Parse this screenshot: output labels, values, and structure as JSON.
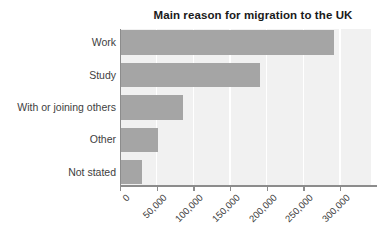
{
  "title": "Main reason for migration to the UK",
  "chart_data": {
    "type": "bar",
    "orientation": "horizontal",
    "title": "Main reason for migration to the UK",
    "categories": [
      "Work",
      "Study",
      "With or joining others",
      "Other",
      "Not stated"
    ],
    "values": [
      290000,
      190000,
      85000,
      51000,
      28000
    ],
    "xlabel": "",
    "ylabel": "",
    "x_ticks": [
      "0",
      "50,000",
      "100,000",
      "150,000",
      "200,000",
      "250,000",
      "300,000"
    ],
    "x_tick_values": [
      0,
      50000,
      100000,
      150000,
      200000,
      250000,
      300000
    ],
    "xlim": [
      0,
      342000
    ],
    "grid": true,
    "legend": false,
    "colors": {
      "bar": "#a5a5a5",
      "plot_background": "#f1f1f1",
      "gridline": "#ffffff",
      "axis": "#8c8c8c",
      "text": "#3e3e3e",
      "title_text": "#1a1a1a",
      "page_background": "#ffffff"
    }
  }
}
